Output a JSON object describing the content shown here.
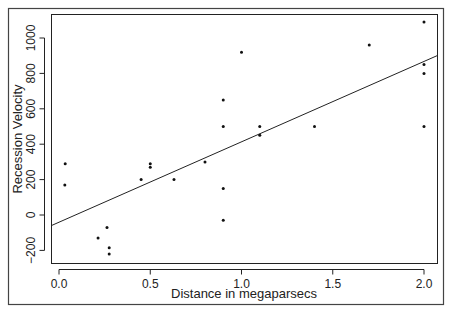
{
  "chart_data": {
    "type": "scatter",
    "title": "",
    "xlabel": "Distance in megaparsecs",
    "ylabel": "Recession Velocity",
    "xlim": [
      -0.03,
      2.07
    ],
    "ylim": [
      -270,
      1120
    ],
    "x_ticks": [
      0.0,
      0.5,
      1.0,
      1.5,
      2.0
    ],
    "x_tick_labels": [
      "0.0",
      "0.5",
      "1.0",
      "1.5",
      "2.0"
    ],
    "y_ticks": [
      -200,
      0,
      200,
      400,
      600,
      800,
      1000
    ],
    "y_tick_labels": [
      "-200",
      "0",
      "200",
      "400",
      "600",
      "800",
      "1000"
    ],
    "grid": false,
    "legend": null,
    "points": [
      {
        "x": 0.032,
        "y": 170
      },
      {
        "x": 0.034,
        "y": 290
      },
      {
        "x": 0.214,
        "y": -130
      },
      {
        "x": 0.263,
        "y": -70
      },
      {
        "x": 0.275,
        "y": -185
      },
      {
        "x": 0.275,
        "y": -220
      },
      {
        "x": 0.45,
        "y": 200
      },
      {
        "x": 0.5,
        "y": 290
      },
      {
        "x": 0.5,
        "y": 270
      },
      {
        "x": 0.63,
        "y": 200
      },
      {
        "x": 0.8,
        "y": 300
      },
      {
        "x": 0.9,
        "y": -30
      },
      {
        "x": 0.9,
        "y": 650
      },
      {
        "x": 0.9,
        "y": 150
      },
      {
        "x": 0.9,
        "y": 500
      },
      {
        "x": 1.0,
        "y": 920
      },
      {
        "x": 1.1,
        "y": 450
      },
      {
        "x": 1.1,
        "y": 500
      },
      {
        "x": 1.4,
        "y": 500
      },
      {
        "x": 1.7,
        "y": 960
      },
      {
        "x": 2.0,
        "y": 500
      },
      {
        "x": 2.0,
        "y": 850
      },
      {
        "x": 2.0,
        "y": 800
      },
      {
        "x": 2.0,
        "y": 1090
      }
    ],
    "fit_line": {
      "intercept": -40.8,
      "slope": 454.2
    }
  }
}
